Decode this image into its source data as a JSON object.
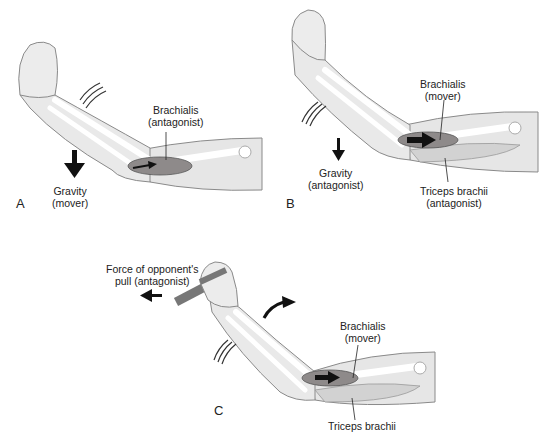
{
  "figure": {
    "panels": [
      {
        "id": "A",
        "letter": "A",
        "labels": {
          "muscle_name": "Brachialis",
          "muscle_role": "(antagonist)",
          "force_name": "Gravity",
          "force_role": "(mover)"
        },
        "icons": [
          "gravity-down-arrow",
          "motion-lines",
          "muscle-pull-arrow"
        ]
      },
      {
        "id": "B",
        "letter": "B",
        "labels": {
          "muscle_name": "Brachialis",
          "muscle_role": "(mover)",
          "force_name": "Gravity",
          "force_role": "(antagonist)",
          "second_muscle_name": "Triceps brachii",
          "second_muscle_role": "(antagonist)"
        },
        "icons": [
          "gravity-down-arrow",
          "motion-lines",
          "muscle-pull-arrow"
        ]
      },
      {
        "id": "C",
        "letter": "C",
        "labels": {
          "force_line1": "Force of opponent's",
          "force_line2": "pull (antagonist)",
          "muscle_name": "Brachialis",
          "muscle_role": "(mover)",
          "second_muscle_name": "Triceps brachii"
        },
        "icons": [
          "left-arrow",
          "curved-arrow",
          "motion-lines",
          "muscle-pull-arrow",
          "rope"
        ]
      }
    ],
    "colors": {
      "skin": "#e6e6e6",
      "skin_outline": "#8a8a8a",
      "bone": "#ffffff",
      "muscle": "#8e8a8a",
      "arrow": "#111111"
    }
  }
}
